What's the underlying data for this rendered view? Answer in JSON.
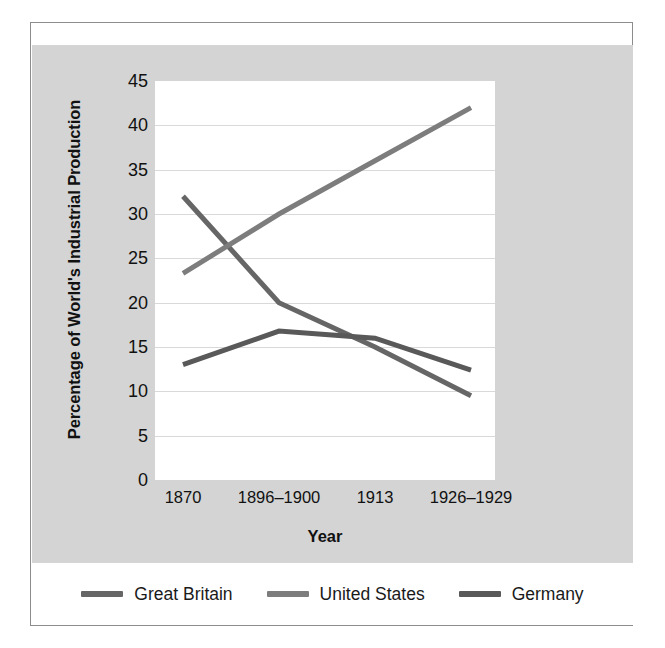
{
  "chart_data": {
    "type": "line",
    "title": "",
    "xlabel": "Year",
    "ylabel": "Percentage of World's Industrial Production",
    "categories": [
      "1870",
      "1896–1900",
      "1913",
      "1926–1929"
    ],
    "ylim": [
      0,
      45
    ],
    "ytick_labels": [
      "0",
      "5",
      "10",
      "15",
      "20",
      "25",
      "30",
      "35",
      "40",
      "45"
    ],
    "ytick_values": [
      0,
      5,
      10,
      15,
      20,
      25,
      30,
      35,
      40,
      45
    ],
    "grid": "horizontal",
    "legend_position": "bottom",
    "series": [
      {
        "name": "Great Britain",
        "color": "#666666",
        "values": [
          32.0,
          20.0,
          15.0,
          9.5
        ]
      },
      {
        "name": "United States",
        "color": "#7d7d7d",
        "values": [
          23.3,
          30.0,
          36.0,
          42.0
        ]
      },
      {
        "name": "Germany",
        "color": "#595959",
        "values": [
          13.0,
          16.8,
          16.0,
          12.4
        ]
      }
    ]
  },
  "legend": {
    "items": [
      {
        "label": "Great Britain",
        "color": "#666666"
      },
      {
        "label": "United States",
        "color": "#7d7d7d"
      },
      {
        "label": "Germany",
        "color": "#595959"
      }
    ]
  },
  "colors": {
    "panel_background": "#d4d4d4",
    "plot_background": "#ffffff",
    "gridline": "#d9d9d9",
    "frame_border": "#8c8c8c",
    "text": "#111111"
  }
}
